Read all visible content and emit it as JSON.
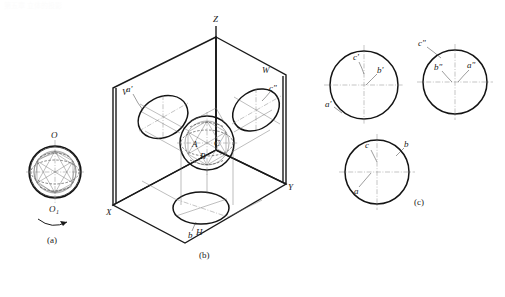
{
  "page": {
    "header_text": "第五章 立体的投影",
    "background": "#ffffff",
    "ink": "#141414"
  },
  "figure": {
    "panels": [
      {
        "id": "a",
        "caption": "(a)",
        "description": "sphere rotation construction"
      },
      {
        "id": "b",
        "caption": "(b)",
        "description": "three-plane projection box"
      },
      {
        "id": "c",
        "caption": "(c)",
        "description": "three orthographic views"
      }
    ]
  },
  "panel_a": {
    "caption": "(a)",
    "top_point": "O",
    "bottom_point": "O",
    "bottom_point_sub": "1",
    "rotation_arrow": "rotation-arrow"
  },
  "panel_b": {
    "caption": "(b)",
    "axes": {
      "z": "Z",
      "x": "X",
      "y": "Y"
    },
    "planes": {
      "v": "V",
      "w": "W",
      "h": "H"
    },
    "projections": {
      "front": "a'",
      "side": "c\"",
      "top": "b"
    },
    "sphere_points": {
      "a": "A",
      "b": "B",
      "c": "C"
    }
  },
  "panel_c": {
    "caption": "(c)",
    "views": [
      {
        "id": "front-view",
        "name": "front-view",
        "labels": [
          {
            "id": "c-prime",
            "text": "c'"
          },
          {
            "id": "b-prime",
            "text": "b'"
          },
          {
            "id": "a-prime",
            "text": "a'"
          }
        ]
      },
      {
        "id": "side-view",
        "name": "side-view",
        "labels": [
          {
            "id": "c-dprime",
            "text": "c\""
          },
          {
            "id": "b-dprime",
            "text": "b\""
          },
          {
            "id": "a-dprime",
            "text": "a\""
          }
        ]
      },
      {
        "id": "top-view",
        "name": "top-view",
        "labels": [
          {
            "id": "c-plain",
            "text": "c"
          },
          {
            "id": "b-plain",
            "text": "b"
          },
          {
            "id": "a-plain",
            "text": "a"
          }
        ]
      }
    ]
  }
}
